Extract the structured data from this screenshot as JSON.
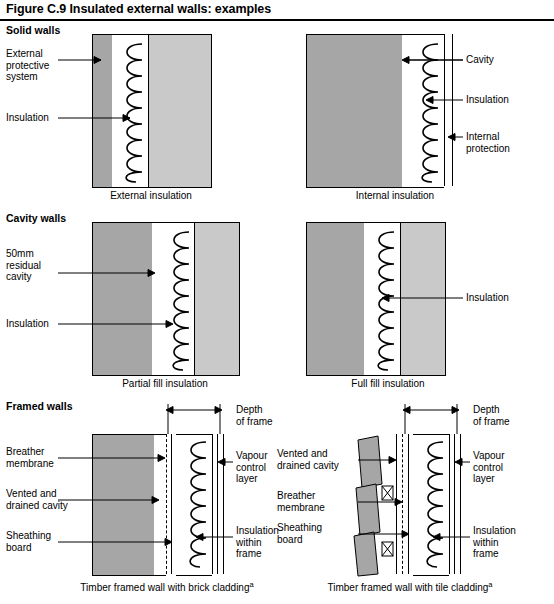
{
  "figure": {
    "title": "Figure C.9 Insulated external walls: examples"
  },
  "sections": [
    {
      "id": "solid",
      "label": "Solid walls"
    },
    {
      "id": "cavity",
      "label": "Cavity walls"
    },
    {
      "id": "framed",
      "label": "Framed walls"
    }
  ],
  "diagrams": [
    {
      "id": "external-insulation",
      "caption": "External insulation",
      "labels": [
        {
          "id": "external-protective-system",
          "text": "External\nprotective\nsystem"
        },
        {
          "id": "insulation",
          "text": "Insulation"
        }
      ]
    },
    {
      "id": "internal-insulation",
      "caption": "Internal insulation",
      "labels": [
        {
          "id": "cavity",
          "text": "Cavity"
        },
        {
          "id": "insulation",
          "text": "Insulation"
        },
        {
          "id": "internal-protection",
          "text": "Internal\nprotection"
        }
      ]
    },
    {
      "id": "partial-fill-insulation",
      "caption": "Partial fill insulation",
      "labels": [
        {
          "id": "residual-cavity",
          "text": "50mm\nresidual\ncavity"
        },
        {
          "id": "insulation",
          "text": "Insulation"
        }
      ]
    },
    {
      "id": "full-fill-insulation",
      "caption": "Full fill insulation",
      "labels": [
        {
          "id": "insulation",
          "text": "Insulation"
        }
      ]
    },
    {
      "id": "timber-framed-brick",
      "caption": "Timber framed wall with brick cladding",
      "caption_footnote": "a",
      "labels": [
        {
          "id": "depth-of-frame",
          "text": "Depth\nof frame"
        },
        {
          "id": "breather-membrane",
          "text": "Breather\nmembrane"
        },
        {
          "id": "vented-and-drained-cavity",
          "text": "Vented and\ndrained cavity"
        },
        {
          "id": "sheathing-board",
          "text": "Sheathing\nboard"
        },
        {
          "id": "vapour-control-layer",
          "text": "Vapour\ncontrol\nlayer"
        },
        {
          "id": "insulation-within-frame",
          "text": "Insulation\nwithin\nframe"
        }
      ]
    },
    {
      "id": "timber-framed-tile",
      "caption": "Timber framed wall with tile cladding",
      "caption_footnote": "a",
      "labels": [
        {
          "id": "depth-of-frame",
          "text": "Depth\nof frame"
        },
        {
          "id": "vented-and-drained-cavity",
          "text": "Vented and\ndrained cavity"
        },
        {
          "id": "breather-membrane",
          "text": "Breather\nmembrane"
        },
        {
          "id": "sheathing-board",
          "text": "Sheathing\nboard"
        },
        {
          "id": "vapour-control-layer",
          "text": "Vapour\ncontrol\nlayer"
        },
        {
          "id": "insulation-within-frame",
          "text": "Insulation\nwithin\nframe"
        }
      ]
    }
  ],
  "colors": {
    "masonry_dark": "#a6a6a6",
    "masonry_light": "#c9c9c9",
    "insulation_stroke": "#000000",
    "line": "#000000",
    "background": "#ffffff"
  }
}
